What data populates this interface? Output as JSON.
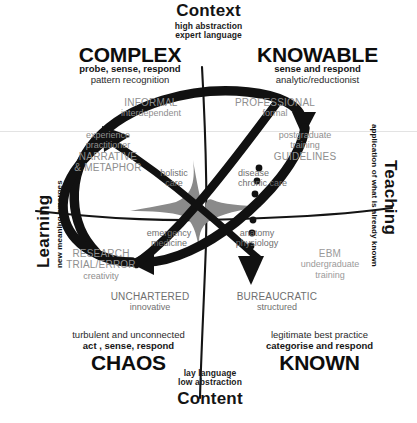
{
  "figure": {
    "background_color": "#ffffff",
    "ink_color": "#111111",
    "annotation_color": "#8e8e8e",
    "center_shape_color": "#8a8a8a"
  },
  "axes": {
    "top": {
      "name": "Context",
      "line1": "high abstraction",
      "line2": "expert language"
    },
    "bottom": {
      "name": "Content",
      "line1": "lay language",
      "line2": "low abstraction"
    },
    "left": {
      "name": "Learning",
      "sub": "new meaning emerges"
    },
    "right": {
      "name": "Teaching",
      "sub": "application of what is already known"
    }
  },
  "domains": {
    "complex": {
      "name": "COMPLEX",
      "action": "probe, sense, respond",
      "note": "pattern recognition"
    },
    "knowable": {
      "name": "KNOWABLE",
      "action": "sense and respond",
      "note": "analytic/reductionist"
    },
    "chaos": {
      "name": "CHAOS",
      "action": "act , sense, respond",
      "note": "turbulent and unconnected"
    },
    "known": {
      "name": "KNOWN",
      "action": "categorise and respond",
      "note": "legitimate best practice"
    }
  },
  "annotations": {
    "informal": {
      "caps": "INFORMAL",
      "sub": "interdependent"
    },
    "professional": {
      "caps": "PROFESSIONAL",
      "sub": "formal"
    },
    "narrative": {
      "line1": "experience",
      "line2": "practitioner",
      "caps1": "NARRATIVE",
      "caps2": "& METAPHOR"
    },
    "guidelines": {
      "line1": "postgraduate",
      "line2": "training",
      "caps": "GUIDELINES"
    },
    "holistic": {
      "line1": "holistic",
      "line2": "care"
    },
    "chronic": {
      "line1": "disease",
      "line2": "chronic care"
    },
    "emergency": {
      "line1": "emergency",
      "line2": "medicine"
    },
    "anatomy": {
      "line1": "anatomy",
      "line2": "physiology"
    },
    "research": {
      "caps1": "RESEARCH",
      "caps2": "TRIAL/ERROR",
      "sub": "creativity"
    },
    "ebm": {
      "caps": "EBM",
      "line1": "undergraduate",
      "line2": "training"
    },
    "unchartered": {
      "caps": "UNCHARTERED",
      "sub": "innovative"
    },
    "bureaucratic": {
      "caps": "BUREAUCRATIC",
      "sub": "structured"
    }
  },
  "caption": {
    "text": ""
  }
}
